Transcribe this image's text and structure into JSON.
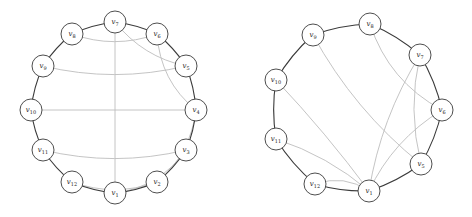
{
  "figures": [
    {
      "id": "left",
      "offset_x": 0,
      "node_radius": 11,
      "nodes": [
        {
          "id": "v1",
          "label": "v",
          "sub": "1",
          "x": 115,
          "y": 193
        },
        {
          "id": "v2",
          "label": "v",
          "sub": "2",
          "x": 157,
          "y": 182
        },
        {
          "id": "v3",
          "label": "v",
          "sub": "3",
          "x": 186,
          "y": 150
        },
        {
          "id": "v4",
          "label": "v",
          "sub": "4",
          "x": 196,
          "y": 110
        },
        {
          "id": "v5",
          "label": "v",
          "sub": "5",
          "x": 186,
          "y": 66
        },
        {
          "id": "v6",
          "label": "v",
          "sub": "6",
          "x": 157,
          "y": 34
        },
        {
          "id": "v7",
          "label": "v",
          "sub": "7",
          "x": 115,
          "y": 22
        },
        {
          "id": "v8",
          "label": "v",
          "sub": "8",
          "x": 72,
          "y": 34
        },
        {
          "id": "v9",
          "label": "v",
          "sub": "9",
          "x": 43,
          "y": 66
        },
        {
          "id": "v10",
          "label": "v",
          "sub": "10",
          "x": 31,
          "y": 110
        },
        {
          "id": "v11",
          "label": "v",
          "sub": "11",
          "x": 43,
          "y": 150
        },
        {
          "id": "v12",
          "label": "v",
          "sub": "12",
          "x": 72,
          "y": 182
        }
      ],
      "cycle": [
        "v1",
        "v2",
        "v3",
        "v4",
        "v5",
        "v6",
        "v7",
        "v8",
        "v9",
        "v10",
        "v11",
        "v12"
      ],
      "chords": [
        {
          "from": "v8",
          "to": "v6",
          "bend": 0.18
        },
        {
          "from": "v7",
          "to": "v1",
          "bend": 0
        },
        {
          "from": "v7",
          "to": "v5",
          "bend": 0.18
        },
        {
          "from": "v6",
          "to": "v4",
          "bend": 0.22
        },
        {
          "from": "v9",
          "to": "v5",
          "bend": 0.12
        },
        {
          "from": "v10",
          "to": "v4",
          "bend": 0
        },
        {
          "from": "v11",
          "to": "v3",
          "bend": -0.12
        },
        {
          "from": "v12",
          "to": "v2",
          "bend": -0.18
        },
        {
          "from": "v1",
          "to": "v3",
          "bend": -0.22
        },
        {
          "from": "v2",
          "to": "v4",
          "bend": -0.2
        }
      ]
    },
    {
      "id": "right",
      "offset_x": 236,
      "node_radius": 11,
      "nodes": [
        {
          "id": "v1",
          "label": "v",
          "sub": "1",
          "x": 133,
          "y": 191
        },
        {
          "id": "v5",
          "label": "v",
          "sub": "5",
          "x": 185,
          "y": 164
        },
        {
          "id": "v6",
          "label": "v",
          "sub": "6",
          "x": 206,
          "y": 110
        },
        {
          "id": "v7",
          "label": "v",
          "sub": "7",
          "x": 184,
          "y": 55
        },
        {
          "id": "v8",
          "label": "v",
          "sub": "8",
          "x": 134,
          "y": 24
        },
        {
          "id": "v9",
          "label": "v",
          "sub": "9",
          "x": 77,
          "y": 35
        },
        {
          "id": "v10",
          "label": "v",
          "sub": "10",
          "x": 40,
          "y": 80
        },
        {
          "id": "v11",
          "label": "v",
          "sub": "11",
          "x": 40,
          "y": 139
        },
        {
          "id": "v12",
          "label": "v",
          "sub": "12",
          "x": 79,
          "y": 184
        }
      ],
      "cycle": [
        "v1",
        "v5",
        "v6",
        "v7",
        "v8",
        "v9",
        "v10",
        "v11",
        "v12"
      ],
      "chords": [
        {
          "from": "v8",
          "to": "v6",
          "bend": 0.2
        },
        {
          "from": "v9",
          "to": "v5",
          "bend": 0.1
        },
        {
          "from": "v7",
          "to": "v1",
          "bend": 0.1
        },
        {
          "from": "v7",
          "to": "v5",
          "bend": 0.12
        },
        {
          "from": "v6",
          "to": "v1",
          "bend": 0.15
        },
        {
          "from": "v10",
          "to": "v1",
          "bend": 0.03
        },
        {
          "from": "v11",
          "to": "v1",
          "bend": 0.1
        },
        {
          "from": "v12",
          "to": "v1",
          "bend": 0.25
        }
      ]
    }
  ]
}
